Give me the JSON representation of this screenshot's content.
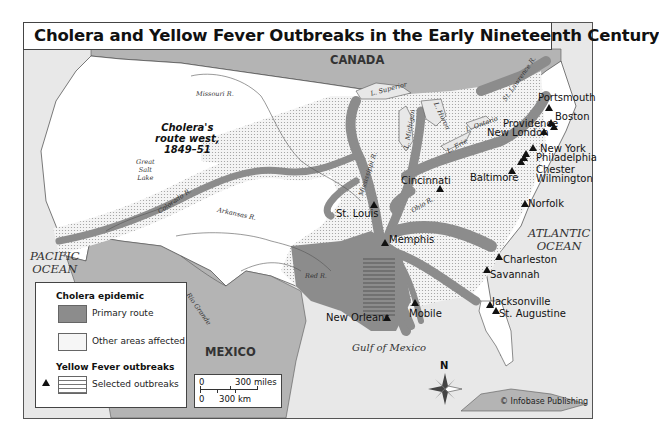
{
  "title": "Cholera and Yellow Fever Outbreaks in the Early Nineteenth Century",
  "regions": {
    "canada": "CANADA",
    "mexico": "MEXICO",
    "pacific": "PACIFIC OCEAN",
    "pacific_l1": "PACIFIC",
    "pacific_l2": "OCEAN",
    "atlantic_l1": "ATLANTIC",
    "atlantic_l2": "OCEAN",
    "gulf": "Gulf of Mexico"
  },
  "annotation": {
    "line1": "Cholera's",
    "line2": "route west,",
    "line3": "1849–51"
  },
  "water_labels": {
    "missouri": "Missouri R.",
    "colorado": "Colorado R.",
    "arkansas": "Arkansas R.",
    "red": "Red R.",
    "rio_grande": "Rio Grande",
    "mississippi": "Mississippi R.",
    "ohio": "Ohio R.",
    "st_lawrence": "St. Lawrence R.",
    "superior": "L. Superior",
    "michigan": "L. Michigan",
    "huron": "L. Huron",
    "erie": "L. Erie",
    "ontario": "L. Ontario",
    "great_salt_l1": "Great",
    "great_salt_l2": "Salt",
    "great_salt_l3": "Lake"
  },
  "cities": [
    {
      "name": "Portsmouth"
    },
    {
      "name": "Boston"
    },
    {
      "name": "Providence"
    },
    {
      "name": "New London"
    },
    {
      "name": "New York"
    },
    {
      "name": "Philadelphia"
    },
    {
      "name": "Chester"
    },
    {
      "name": "Wilmington"
    },
    {
      "name": "Baltimore"
    },
    {
      "name": "Norfolk"
    },
    {
      "name": "Cincinnati"
    },
    {
      "name": "St. Louis"
    },
    {
      "name": "Memphis"
    },
    {
      "name": "Charleston"
    },
    {
      "name": "Savannah"
    },
    {
      "name": "Jacksonville"
    },
    {
      "name": "St. Augustine"
    },
    {
      "name": "Mobile"
    },
    {
      "name": "New Orleans"
    }
  ],
  "legend": {
    "cholera_heading": "Cholera epidemic",
    "primary_route": "Primary route",
    "other_areas": "Other areas affected",
    "yf_heading": "Yellow Fever outbreaks",
    "selected": "Selected outbreaks"
  },
  "scale": {
    "zero_mi": "0",
    "miles": "300 miles",
    "zero_km": "0",
    "km": "300 km"
  },
  "compass": {
    "north": "N"
  },
  "credit": "© Infobase Publishing",
  "colors": {
    "primary_route": "#8c8c8c",
    "other_areas": "#d9d9d9",
    "land": "#ffffff",
    "water": "#e6e6e6",
    "foreign_land": "#b3b3b3"
  }
}
